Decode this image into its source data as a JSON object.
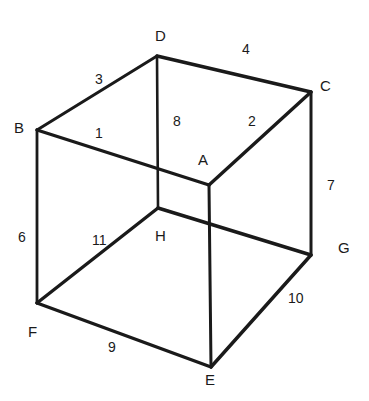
{
  "figure": {
    "background_color": "#ffffff",
    "line_color": "#1a1a1a",
    "text_color": "#1a1a1a",
    "width": 369,
    "height": 401
  },
  "vertices": [
    {
      "id": "D",
      "label": "D",
      "x": 157,
      "y": 56,
      "label_x": 155,
      "label_y": 28
    },
    {
      "id": "C",
      "label": "C",
      "x": 311,
      "y": 92,
      "label_x": 320,
      "label_y": 78
    },
    {
      "id": "B",
      "label": "B",
      "x": 37,
      "y": 130,
      "label_x": 14,
      "label_y": 120
    },
    {
      "id": "A",
      "label": "A",
      "x": 209,
      "y": 185,
      "label_x": 198,
      "label_y": 152
    },
    {
      "id": "H",
      "label": "H",
      "x": 158,
      "y": 208,
      "label_x": 155,
      "label_y": 228
    },
    {
      "id": "G",
      "label": "G",
      "x": 311,
      "y": 255,
      "label_x": 338,
      "label_y": 240
    },
    {
      "id": "F",
      "label": "F",
      "x": 37,
      "y": 303,
      "label_x": 28,
      "label_y": 324
    },
    {
      "id": "E",
      "label": "E",
      "x": 211,
      "y": 367,
      "label_x": 205,
      "label_y": 372
    }
  ],
  "edges": [
    {
      "id": "edge-1",
      "from": "B",
      "to": "A",
      "label": "1",
      "label_x": 95,
      "label_y": 126
    },
    {
      "id": "edge-2",
      "from": "A",
      "to": "C",
      "label": "2",
      "label_x": 248,
      "label_y": 114
    },
    {
      "id": "edge-3",
      "from": "B",
      "to": "D",
      "label": "3",
      "label_x": 95,
      "label_y": 72
    },
    {
      "id": "edge-4",
      "from": "D",
      "to": "C",
      "label": "4",
      "label_x": 242,
      "label_y": 42
    },
    {
      "id": "edge-6",
      "from": "B",
      "to": "F",
      "label": "6",
      "label_x": 18,
      "label_y": 230
    },
    {
      "id": "edge-7",
      "from": "C",
      "to": "G",
      "label": "7",
      "label_x": 327,
      "label_y": 178
    },
    {
      "id": "edge-8",
      "from": "D",
      "to": "H",
      "label": "8",
      "label_x": 173,
      "label_y": 114
    },
    {
      "id": "edge-9",
      "from": "F",
      "to": "E",
      "label": "9",
      "label_x": 108,
      "label_y": 340
    },
    {
      "id": "edge-10",
      "from": "E",
      "to": "G",
      "label": "10",
      "label_x": 288,
      "label_y": 291
    },
    {
      "id": "edge-11",
      "from": "H",
      "to": "F",
      "label": "11",
      "label_x": 92,
      "label_y": 233
    },
    {
      "id": "edge-ae",
      "from": "A",
      "to": "E",
      "label": "",
      "label_x": 0,
      "label_y": 0
    },
    {
      "id": "edge-hg",
      "from": "H",
      "to": "G",
      "label": "",
      "label_x": 0,
      "label_y": 0
    }
  ],
  "edge_labels": {
    "n1": "1",
    "n2": "2",
    "n3": "3",
    "n4": "4",
    "n6": "6",
    "n7": "7",
    "n8": "8",
    "n9": "9",
    "n10": "10",
    "n11": "11"
  },
  "vertex_labels": {
    "A": "A",
    "B": "B",
    "C": "C",
    "D": "D",
    "E": "E",
    "F": "F",
    "G": "G",
    "H": "H"
  }
}
